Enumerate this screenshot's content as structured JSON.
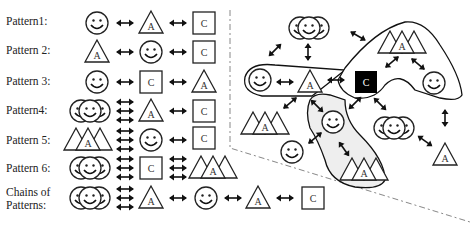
{
  "patterns": [
    {
      "label": "Pattern1:",
      "sequence": [
        "smiley",
        "triangle-A",
        "square-C"
      ]
    },
    {
      "label": "Pattern 2:",
      "sequence": [
        "triangle-A",
        "smiley",
        "square-C"
      ]
    },
    {
      "label": "Pattern 3:",
      "sequence": [
        "smiley",
        "square-C",
        "triangle-A"
      ]
    },
    {
      "label": "Pattern4:",
      "sequence": [
        "smiley-group",
        "triangle-A",
        "square-C"
      ]
    },
    {
      "label": "Pattern 5:",
      "sequence": [
        "triangle-group",
        "smiley",
        "square-C"
      ]
    },
    {
      "label": "Pattern 6:",
      "sequence": [
        "smiley-group",
        "square-C",
        "triangle-group"
      ]
    }
  ],
  "chains": {
    "label_line1": "Chains of",
    "label_line2": "Patterns:",
    "sequence": [
      "smiley-group",
      "triangle-A",
      "smiley",
      "triangle-A",
      "square-C"
    ]
  },
  "glyphs": {
    "triangle_letter": "A",
    "square_letter": "C"
  },
  "network": {
    "nodes": [
      "smiley-group-top",
      "triangle-group-top-right",
      "smiley-left",
      "triangle-A-center",
      "square-C-black-center",
      "smiley-right",
      "triangle-group-left",
      "smiley-mid",
      "smiley-group-right",
      "smiley-lower",
      "triangle-group-bottom",
      "triangle-A-bottom-right"
    ],
    "highlight_color": "#000000"
  }
}
